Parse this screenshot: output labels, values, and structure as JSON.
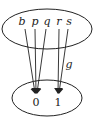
{
  "diagram": {
    "type": "function-mapping",
    "domain_set": {
      "elements": [
        "b",
        "p",
        "q",
        "r",
        "s"
      ]
    },
    "codomain_set": {
      "elements": [
        "0",
        "1"
      ]
    },
    "function_label": "g",
    "mappings": [
      {
        "from": "b",
        "to": "0"
      },
      {
        "from": "p",
        "to": "0"
      },
      {
        "from": "q",
        "to": "0"
      },
      {
        "from": "r",
        "to": "1"
      },
      {
        "from": "s",
        "to": "1"
      }
    ],
    "colors": {
      "stroke": "#222222",
      "background": "#ffffff"
    }
  }
}
